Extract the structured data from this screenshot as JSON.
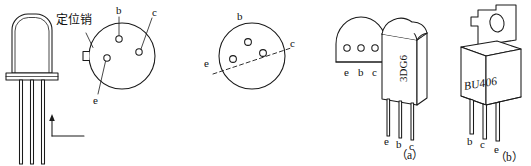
{
  "figure": {
    "line_color": "#1a1a1a",
    "fill_color": "#ffffff",
    "captions": [
      {
        "id": "a",
        "text": "（a）"
      },
      {
        "id": "b",
        "text": "（b）"
      }
    ]
  },
  "annotations": {
    "locating_pin": "定位销"
  },
  "metal_can_side_view": {
    "name": "TO-18 metal can transistor, side view",
    "lead_count": 3
  },
  "bottom_view_1": {
    "name": "bottom view with locating pin",
    "pins": [
      {
        "label": "b",
        "position": "top-center"
      },
      {
        "label": "c",
        "position": "right"
      },
      {
        "label": "e",
        "position": "left-lower"
      }
    ],
    "has_locating_pin": true
  },
  "bottom_view_2": {
    "name": "bottom view with reference dashed line",
    "pins": [
      {
        "label": "b",
        "position": "top"
      },
      {
        "label": "c",
        "position": "right"
      },
      {
        "label": "e",
        "position": "left"
      }
    ],
    "has_dashed_reference_line": true
  },
  "d_shape_view": {
    "name": "flat-side plastic package bottom view",
    "pin_labels": [
      "e",
      "b",
      "c"
    ]
  },
  "package_3dg6": {
    "name": "3DG6 plastic transistor",
    "marking": "3DG6",
    "lead_labels": [
      "e",
      "b",
      "c"
    ]
  },
  "package_bu406": {
    "name": "BU406 TO-220 power transistor",
    "marking": "BU406",
    "lead_labels": [
      "b",
      "c",
      "e"
    ],
    "has_mounting_hole": true
  }
}
